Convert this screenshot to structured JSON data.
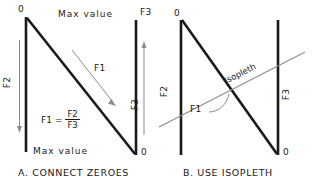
{
  "figure": {
    "type": "nomograph-construction-diagram",
    "ink_color": "#1a1a1a",
    "thin_color": "#8c8c8c",
    "panels": [
      {
        "id": "A",
        "caption": "A. CONNECT ZEROES",
        "left_axis": {
          "name": "F2",
          "label": "F2",
          "top_tick_label": "0",
          "bottom_tick_label": "Max value",
          "direction": "zero-at-top"
        },
        "right_axis": {
          "name": "F3",
          "label": "F3",
          "top_tick_label": "Max value",
          "bottom_tick_label": "0",
          "direction": "zero-at-bottom"
        },
        "diagonal": {
          "name": "F1",
          "label": "F1",
          "from": "top of F2 (zero)",
          "to": "bottom of F3 (zero)"
        },
        "formula": {
          "lhs": "F1",
          "equals": "=",
          "numerator": "F2",
          "denominator": "F3",
          "text": "F1 = F2 / F3"
        }
      },
      {
        "id": "B",
        "caption": "B. USE ISOPLETH",
        "left_axis": {
          "name": "F2",
          "label": "F2",
          "top_tick_label": "0",
          "bottom_tick_label": "",
          "direction": "zero-at-top"
        },
        "right_axis": {
          "name": "F3",
          "label": "F3",
          "top_tick_label": "",
          "bottom_tick_label": "0",
          "direction": "zero-at-bottom"
        },
        "diagonal": {
          "name": "F1",
          "label": "F1",
          "from": "top of F2 (zero)",
          "to": "bottom of F3 (zero)"
        },
        "isopleth": {
          "label": "Isopleth",
          "description": "straight line crossing F2 axis, the F1 diagonal and the F3 axis"
        }
      }
    ]
  }
}
